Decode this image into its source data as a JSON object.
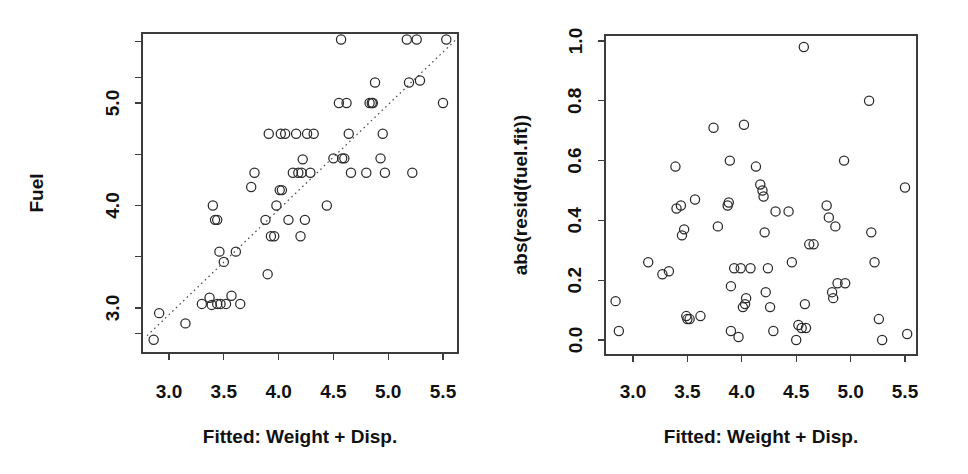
{
  "figure": {
    "background": "#ffffff",
    "marker_color": "#2a2a2a",
    "axis_color": "#3c3c3c",
    "panel_count": 2
  },
  "chart_data": [
    {
      "type": "scatter",
      "panel": "left",
      "title": "",
      "xlabel": "Fitted: Weight + Disp.",
      "ylabel": "Fuel",
      "xlim": [
        2.78,
        5.66
      ],
      "ylim": [
        2.62,
        5.66
      ],
      "xticks": [
        3.0,
        3.5,
        4.0,
        4.5,
        5.0,
        5.5
      ],
      "xticklabels": [
        "3.0",
        "3.5",
        "4.0",
        "4.5",
        "5.0",
        "5.5"
      ],
      "yticks": [
        3.0,
        4.0,
        5.0
      ],
      "yticklabels": [
        "3.0",
        "4.0",
        "5.0"
      ],
      "minor_yticks": [
        2.75,
        3.5,
        4.5,
        5.25,
        5.6
      ],
      "grid": false,
      "legend": null,
      "marker": "open-circle",
      "reference_line": {
        "style": "dotted",
        "label": "y = x identity line",
        "x": [
          2.8,
          5.62
        ],
        "y": [
          2.73,
          5.62
        ]
      },
      "x": [
        2.86,
        2.91,
        3.15,
        3.3,
        3.37,
        3.39,
        3.4,
        3.42,
        3.44,
        3.44,
        3.46,
        3.47,
        3.5,
        3.52,
        3.57,
        3.61,
        3.65,
        3.75,
        3.78,
        3.88,
        3.9,
        3.91,
        3.93,
        3.96,
        3.98,
        4.01,
        4.02,
        4.03,
        4.06,
        4.09,
        4.13,
        4.16,
        4.18,
        4.2,
        4.21,
        4.22,
        4.24,
        4.26,
        4.29,
        4.32,
        4.44,
        4.5,
        4.55,
        4.57,
        4.58,
        4.6,
        4.62,
        4.64,
        4.66,
        4.8,
        4.83,
        4.85,
        4.86,
        4.88,
        4.93,
        4.95,
        4.97,
        5.17,
        5.19,
        5.22,
        5.26,
        5.29,
        5.5,
        5.53
      ],
      "y": [
        2.69,
        2.95,
        2.85,
        3.04,
        3.1,
        3.03,
        4.0,
        3.86,
        3.86,
        3.04,
        3.55,
        3.04,
        3.45,
        3.04,
        3.12,
        3.55,
        3.04,
        4.18,
        4.32,
        3.86,
        3.33,
        4.7,
        3.7,
        3.7,
        4.0,
        4.15,
        4.7,
        4.15,
        4.7,
        3.86,
        4.32,
        4.7,
        4.32,
        3.7,
        4.32,
        4.45,
        3.86,
        4.7,
        4.32,
        4.7,
        4.0,
        4.46,
        5.0,
        5.62,
        4.46,
        4.46,
        5.0,
        4.7,
        4.32,
        4.32,
        5.0,
        5.0,
        5.0,
        5.2,
        4.46,
        4.7,
        4.32,
        5.62,
        5.2,
        4.32,
        5.62,
        5.22,
        5.0,
        5.62
      ]
    },
    {
      "type": "scatter",
      "panel": "right",
      "title": "",
      "xlabel": "Fitted: Weight + Disp.",
      "ylabel": "abs(resid(fuel.fit))",
      "xlim": [
        2.78,
        5.62
      ],
      "ylim": [
        -0.02,
        1.03
      ],
      "xticks": [
        3.0,
        3.5,
        4.0,
        4.5,
        5.0,
        5.5
      ],
      "xticklabels": [
        "3.0",
        "3.5",
        "4.0",
        "4.5",
        "5.0",
        "5.5"
      ],
      "yticks": [
        0.0,
        0.2,
        0.4,
        0.6,
        0.8,
        1.0
      ],
      "yticklabels": [
        "0.0",
        "0.2",
        "0.4",
        "0.6",
        "0.8",
        "1.0"
      ],
      "grid": false,
      "legend": null,
      "marker": "open-circle",
      "reference_line": null,
      "x": [
        2.84,
        2.87,
        3.14,
        3.27,
        3.33,
        3.39,
        3.4,
        3.44,
        3.45,
        3.47,
        3.49,
        3.5,
        3.52,
        3.57,
        3.62,
        3.74,
        3.78,
        3.87,
        3.88,
        3.89,
        3.9,
        3.9,
        3.93,
        3.97,
        3.99,
        4.01,
        4.02,
        4.03,
        4.04,
        4.08,
        4.13,
        4.17,
        4.19,
        4.2,
        4.21,
        4.22,
        4.24,
        4.26,
        4.29,
        4.31,
        4.43,
        4.46,
        4.5,
        4.52,
        4.55,
        4.57,
        4.58,
        4.59,
        4.62,
        4.66,
        4.78,
        4.8,
        4.83,
        4.84,
        4.86,
        4.88,
        4.94,
        4.95,
        5.17,
        5.19,
        5.22,
        5.26,
        5.29,
        5.5,
        5.52
      ],
      "y": [
        0.13,
        0.03,
        0.26,
        0.22,
        0.23,
        0.58,
        0.44,
        0.45,
        0.35,
        0.37,
        0.08,
        0.07,
        0.07,
        0.47,
        0.08,
        0.71,
        0.38,
        0.45,
        0.46,
        0.6,
        0.18,
        0.03,
        0.24,
        0.01,
        0.24,
        0.11,
        0.72,
        0.12,
        0.14,
        0.24,
        0.58,
        0.52,
        0.5,
        0.48,
        0.36,
        0.16,
        0.24,
        0.11,
        0.03,
        0.43,
        0.43,
        0.26,
        0.0,
        0.05,
        0.04,
        0.98,
        0.12,
        0.04,
        0.32,
        0.32,
        0.45,
        0.41,
        0.16,
        0.14,
        0.38,
        0.19,
        0.6,
        0.19,
        0.8,
        0.36,
        0.26,
        0.07,
        0.0,
        0.51,
        0.02
      ]
    }
  ],
  "panels": {
    "left": {
      "name": "fuel-vs-fitted",
      "ylabel": "Fuel",
      "xlabel": "Fitted: Weight + Disp.",
      "xticklabels": [
        "3.0",
        "3.5",
        "4.0",
        "4.5",
        "5.0",
        "5.5"
      ],
      "yticklabels": [
        "3.0",
        "4.0",
        "5.0"
      ]
    },
    "right": {
      "name": "absresid-vs-fitted",
      "ylabel": "abs(resid(fuel.fit))",
      "xlabel": "Fitted: Weight + Disp.",
      "xticklabels": [
        "3.0",
        "3.5",
        "4.0",
        "4.5",
        "5.0",
        "5.5"
      ],
      "yticklabels": [
        "0.0",
        "0.2",
        "0.4",
        "0.6",
        "0.8",
        "1.0"
      ]
    }
  }
}
